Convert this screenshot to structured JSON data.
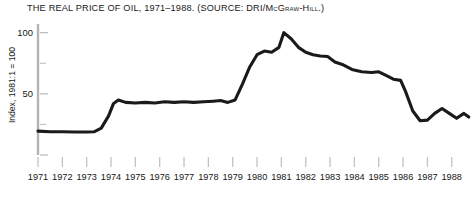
{
  "figure": {
    "title_prefix": "THE REAL PRICE OF OIL, 1971–1988. (",
    "title": "THE REAL PRICE OF OIL, 1971–1988. (SOURCE: DRI/McGraw-Hill.)",
    "background_color": "#ffffff",
    "line_color": "#1a1a1a",
    "axis_color": "#b4b4b4",
    "text_color": "#161616"
  },
  "chart_data": {
    "type": "line",
    "title": "THE REAL PRICE OF OIL, 1971–1988. (SOURCE: DRI/McGraw-Hill.)",
    "source": "DRI/McGraw-Hill",
    "xlabel": "",
    "ylabel": "Index, 1981:1 = 100",
    "xlim": [
      1971,
      1988.75
    ],
    "ylim": [
      0,
      112
    ],
    "yticks": [
      0,
      50,
      100
    ],
    "ytick_labels": [
      "",
      "50",
      "100"
    ],
    "yticks_minor": [
      25,
      75
    ],
    "grid": false,
    "legend": false,
    "categories": [
      "1971",
      "1972",
      "1973",
      "1974",
      "1975",
      "1976",
      "1977",
      "1978",
      "1979",
      "1980",
      "1981",
      "1982",
      "1983",
      "1984",
      "1985",
      "1986",
      "1987",
      "1988"
    ],
    "series": [
      {
        "name": "Real price of oil",
        "x": [
          1971.0,
          1971.5,
          1972.0,
          1972.5,
          1973.0,
          1973.3,
          1973.6,
          1973.9,
          1974.1,
          1974.3,
          1974.6,
          1975.0,
          1975.4,
          1975.8,
          1976.2,
          1976.6,
          1977.0,
          1977.4,
          1977.8,
          1978.2,
          1978.5,
          1978.8,
          1979.1,
          1979.4,
          1979.7,
          1980.0,
          1980.3,
          1980.6,
          1980.9,
          1981.1,
          1981.4,
          1981.7,
          1982.0,
          1982.3,
          1982.6,
          1982.9,
          1983.2,
          1983.5,
          1983.9,
          1984.3,
          1984.7,
          1985.0,
          1985.3,
          1985.6,
          1985.9,
          1986.1,
          1986.4,
          1986.7,
          1987.0,
          1987.3,
          1987.6,
          1987.9,
          1988.2,
          1988.5,
          1988.7
        ],
        "values": [
          19.5,
          19.0,
          19.0,
          18.8,
          18.8,
          19.0,
          22.0,
          32.0,
          42.0,
          45.0,
          43.0,
          42.5,
          43.0,
          42.5,
          43.5,
          43.0,
          43.5,
          43.0,
          43.5,
          44.0,
          44.5,
          43.0,
          45.0,
          58.0,
          72.0,
          82.0,
          85.0,
          84.0,
          88.0,
          100.0,
          95.0,
          88.0,
          84.0,
          82.0,
          81.0,
          80.5,
          76.0,
          74.0,
          70.0,
          68.0,
          67.5,
          68.0,
          65.0,
          62.0,
          61.0,
          52.0,
          36.0,
          28.0,
          28.5,
          34.0,
          38.0,
          34.0,
          30.0,
          34.0,
          31.0
        ]
      }
    ],
    "annotations": []
  },
  "axes": {
    "y_title": "Index, 1981:1 = 100",
    "y_labels": [
      {
        "value": 100,
        "text": "100"
      },
      {
        "value": 50,
        "text": "50"
      }
    ],
    "x_labels": [
      {
        "value": 1971,
        "text": "1971"
      },
      {
        "value": 1972,
        "text": "1972"
      },
      {
        "value": 1973,
        "text": "1973"
      },
      {
        "value": 1974,
        "text": "1974"
      },
      {
        "value": 1975,
        "text": "1975"
      },
      {
        "value": 1976,
        "text": "1976"
      },
      {
        "value": 1977,
        "text": "1977"
      },
      {
        "value": 1978,
        "text": "1978"
      },
      {
        "value": 1979,
        "text": "1979"
      },
      {
        "value": 1980,
        "text": "1980"
      },
      {
        "value": 1981,
        "text": "1981"
      },
      {
        "value": 1982,
        "text": "1982"
      },
      {
        "value": 1983,
        "text": "1983"
      },
      {
        "value": 1984,
        "text": "1984"
      },
      {
        "value": 1985,
        "text": "1985"
      },
      {
        "value": 1986,
        "text": "1986"
      },
      {
        "value": 1987,
        "text": "1987"
      },
      {
        "value": 1988,
        "text": "1988"
      }
    ]
  }
}
